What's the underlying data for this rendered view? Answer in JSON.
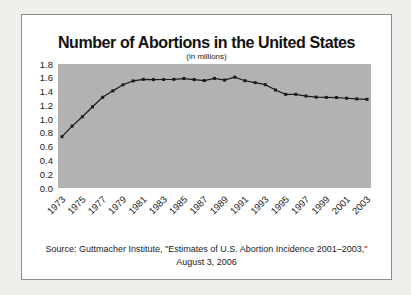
{
  "page": {
    "background": "#f0efeb"
  },
  "card": {
    "background": "#ffffff",
    "border_color": "#8c8c8c"
  },
  "chart_data": {
    "type": "line",
    "title": "Number of Abortions in the United States",
    "subtitle": "(in millions)",
    "x": [
      1973,
      1974,
      1975,
      1976,
      1977,
      1978,
      1979,
      1980,
      1981,
      1982,
      1983,
      1984,
      1985,
      1986,
      1987,
      1988,
      1989,
      1990,
      1991,
      1992,
      1993,
      1994,
      1995,
      1996,
      1997,
      1998,
      1999,
      2000,
      2001,
      2002,
      2003
    ],
    "values": [
      0.745,
      0.899,
      1.034,
      1.179,
      1.317,
      1.41,
      1.498,
      1.554,
      1.577,
      1.574,
      1.575,
      1.577,
      1.589,
      1.574,
      1.559,
      1.591,
      1.567,
      1.609,
      1.557,
      1.529,
      1.5,
      1.423,
      1.359,
      1.36,
      1.335,
      1.319,
      1.315,
      1.313,
      1.303,
      1.293,
      1.287
    ],
    "x_tick_labels": [
      "1973",
      "1975",
      "1977",
      "1979",
      "1981",
      "1983",
      "1985",
      "1987",
      "1989",
      "1991",
      "1993",
      "1995",
      "1997",
      "1999",
      "2001",
      "2003"
    ],
    "y_tick_labels": [
      "1.8",
      "1.6",
      "1.4",
      "1.2",
      "1.0",
      "0.8",
      "0.6",
      "0.4",
      "0.2",
      "0.0"
    ],
    "ylim": [
      0,
      1.8
    ],
    "grid": false,
    "legend": "none",
    "plot_bg": "#b2b2b2",
    "line_color": "#1a1a1a",
    "marker": "square",
    "source_line1": "Source: Guttmacher Institute, \"Estimates of U.S. Abortion Incidence 2001–2003,\"",
    "source_line2": "August 3, 2006"
  }
}
